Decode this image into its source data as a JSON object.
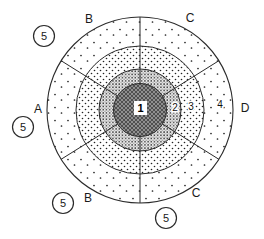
{
  "figure": {
    "type": "concentric-zone-diagram",
    "core": {
      "label": "1"
    },
    "rings": [
      {
        "id": "ring-2",
        "label": "2",
        "texture": "dense-stipple"
      },
      {
        "id": "ring-3",
        "label": "3",
        "texture": "medium-dots"
      },
      {
        "id": "ring-4",
        "label": "4",
        "texture": "sparse-dots"
      }
    ],
    "sectors": [
      {
        "label": "B",
        "position": "top-left"
      },
      {
        "label": "C",
        "position": "top-right"
      },
      {
        "label": "A",
        "position": "left"
      },
      {
        "label": "D",
        "position": "right"
      },
      {
        "label": "B",
        "position": "bottom-left"
      },
      {
        "label": "C",
        "position": "bottom-right"
      }
    ],
    "callouts": [
      {
        "label": "5",
        "position": "top-left"
      },
      {
        "label": "5",
        "position": "left"
      },
      {
        "label": "5",
        "position": "bottom-left"
      },
      {
        "label": "5",
        "position": "bottom-center"
      }
    ],
    "colors": {
      "line": "#2b2b2b",
      "core_fill": "#8f8f8f",
      "core_hatch": "#4f4f4f",
      "background": "#ffffff"
    }
  }
}
